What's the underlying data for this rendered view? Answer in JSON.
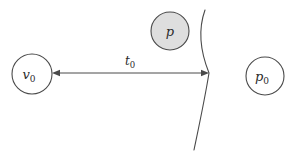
{
  "diagram": {
    "type": "geometric-schematic",
    "background_color": "#ffffff",
    "stroke_color": "#4a4a4a",
    "text_color": "#2b2b2b",
    "nodes": [
      {
        "id": "v0",
        "name": "node-v0",
        "label_main": "v",
        "label_sub": "0",
        "cx": 32,
        "cy": 74,
        "r": 20,
        "fill": "#ffffff",
        "stroke": "#4a4a4a"
      },
      {
        "id": "p",
        "name": "node-p",
        "label_main": "p",
        "label_sub": "",
        "cx": 170,
        "cy": 31,
        "r": 19,
        "fill": "#dedede",
        "stroke": "#4a4a4a"
      },
      {
        "id": "p0",
        "name": "node-p0",
        "label_main": "p",
        "label_sub": "0",
        "cx": 265,
        "cy": 76,
        "r": 19,
        "fill": "#ffffff",
        "stroke": "#4a4a4a"
      }
    ],
    "edges": [
      {
        "id": "t0",
        "name": "edge-t0",
        "label_main": "t",
        "label_sub": "0",
        "label_x": 130,
        "label_y": 65,
        "x1": 52,
        "y1": 73,
        "x2": 209,
        "y2": 73,
        "arrow_start": true,
        "arrow_end": true,
        "stroke": "#4a4a4a"
      }
    ],
    "arc": {
      "id": "boundary-arc",
      "name": "boundary-arc",
      "path": "M 205 10 C 196 35, 203 58, 209 73 C 205 98, 199 126, 194 150",
      "stroke": "#4a4a4a",
      "fill": "none"
    }
  }
}
